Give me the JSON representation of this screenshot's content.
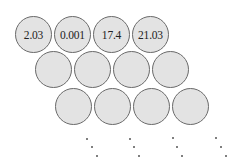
{
  "diagram": {
    "colors": {
      "fill": "#e3e3e3",
      "stroke": "#6a6a6a",
      "text": "#222222"
    },
    "rows": [
      {
        "cells": [
          {
            "label": "2.03"
          },
          {
            "label": "0.001"
          },
          {
            "label": "17.4"
          },
          {
            "label": "21.03"
          }
        ]
      },
      {
        "cells": [
          {
            "label": ""
          },
          {
            "label": ""
          },
          {
            "label": ""
          },
          {
            "label": ""
          }
        ]
      },
      {
        "cells": [
          {
            "label": ""
          },
          {
            "label": ""
          },
          {
            "label": ""
          },
          {
            "label": ""
          }
        ]
      }
    ],
    "continuation": "diagonal ellipsis dots below each column of the last row"
  }
}
